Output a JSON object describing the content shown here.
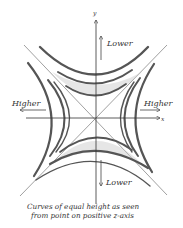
{
  "diagram": {
    "title": "Curves of equal height as seen from point on positive z-axis",
    "caption_lines": [
      "Curves of equal height as seen",
      "from point on positive z-axis"
    ],
    "axes": {
      "x_label": "x",
      "y_label": "y"
    },
    "labels": {
      "top": "Lower",
      "bottom": "Lower",
      "left": "Higher",
      "right": "Higher"
    },
    "colors": {
      "stroke": "#3a3a3a",
      "shade": "#9a9a9a",
      "background": "#ffffff"
    }
  }
}
